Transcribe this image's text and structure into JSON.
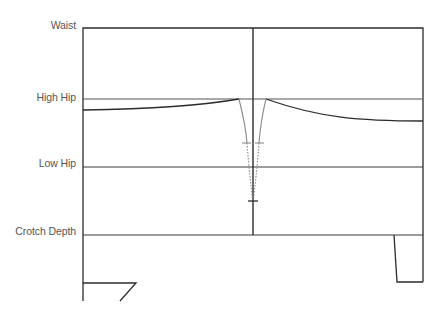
{
  "diagram": {
    "labels": {
      "waist": "Waist",
      "high_hip": "High Hip",
      "low_hip": "Low Hip",
      "crotch_depth": "Crotch Depth"
    },
    "colors": {
      "line": "#2b2b2b",
      "guide_line": "#555555",
      "dart": "#8a8a8a",
      "label_text": "#555555"
    },
    "levels_y": {
      "waist": 28,
      "high_hip": 99,
      "low_hip": 167,
      "crotch_depth": 235
    }
  }
}
